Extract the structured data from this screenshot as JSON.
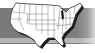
{
  "image": {
    "subject": "united-states-map-icon",
    "colors": {
      "background": "#ffffff",
      "band": "#7a7a7a",
      "band_light": "#b8b8b8",
      "map_fill": "#ffffff",
      "state_lines": "#333333",
      "shadow": "#1a1a1a"
    }
  }
}
